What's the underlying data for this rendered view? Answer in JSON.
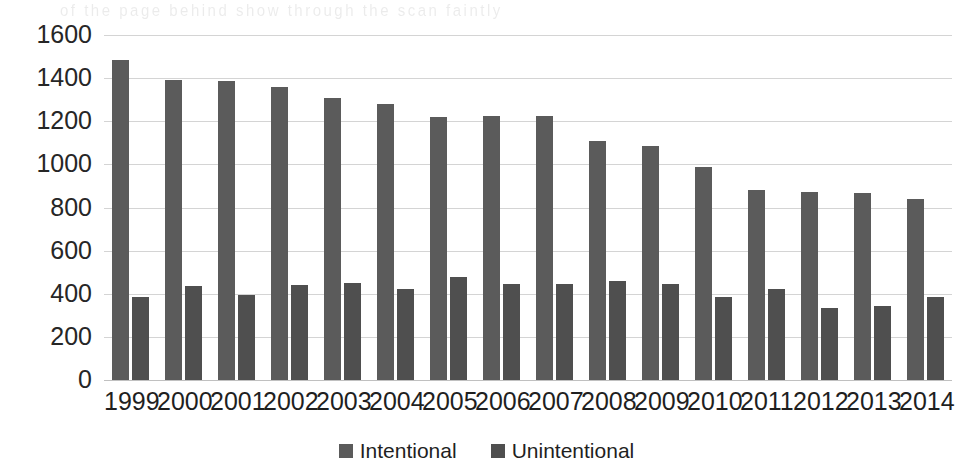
{
  "chart_data": {
    "type": "bar",
    "title": "",
    "subtitle": "",
    "xlabel": "",
    "ylabel": "",
    "categories": [
      "1999",
      "2000",
      "2001",
      "2002",
      "2003",
      "2004",
      "2005",
      "2006",
      "2007",
      "2008",
      "2009",
      "2010",
      "2011",
      "2012",
      "2013",
      "2014"
    ],
    "series": [
      {
        "name": "Intentional",
        "color": "#5b5b5b",
        "values": [
          1485,
          1390,
          1388,
          1357,
          1310,
          1282,
          1220,
          1225,
          1225,
          1110,
          1085,
          990,
          880,
          874,
          865,
          838
        ]
      },
      {
        "name": "Unintentional",
        "color": "#4f4f4f",
        "values": [
          384,
          435,
          393,
          440,
          452,
          420,
          476,
          443,
          446,
          458,
          443,
          384,
          422,
          335,
          343,
          386
        ]
      }
    ],
    "ylim": [
      0,
      1600
    ],
    "ytick_step": 200,
    "yticks": [
      "1600",
      "1400",
      "1200",
      "1000",
      "800",
      "600",
      "400",
      "200",
      "0"
    ],
    "grid": true,
    "legend_position": "bottom"
  },
  "legend": {
    "items": [
      {
        "label": "Intentional",
        "swatch_color": "#5b5b5b"
      },
      {
        "label": "Unintentional",
        "swatch_color": "#4f4f4f"
      }
    ]
  },
  "artifacts": {
    "bleed_through_text": "of the page behind show through the scan faintly"
  }
}
